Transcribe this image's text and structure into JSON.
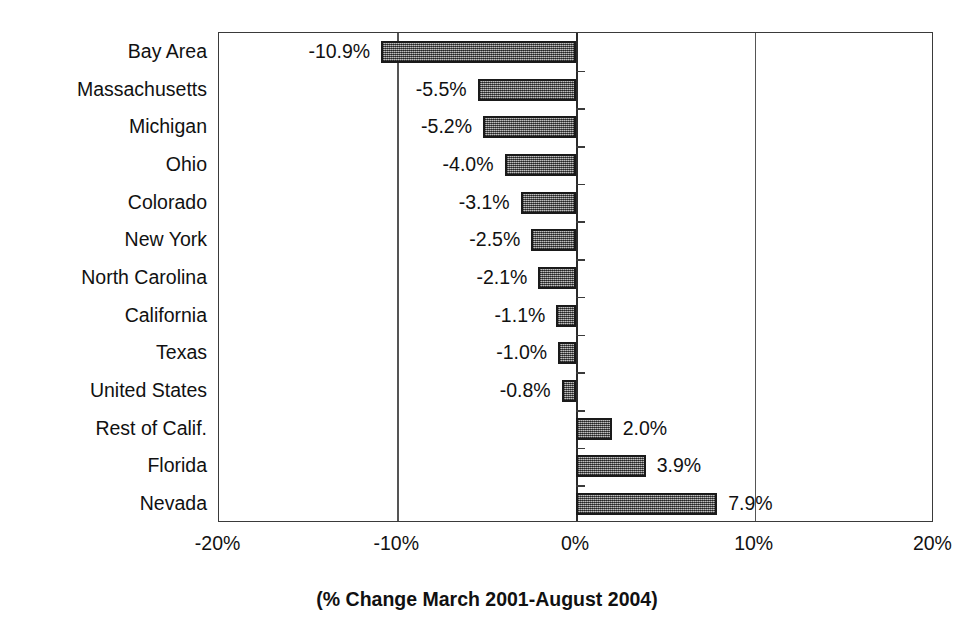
{
  "chart_data": {
    "type": "bar",
    "orientation": "horizontal",
    "title": "",
    "xlabel": "(% Change March 2001-August 2004)",
    "ylabel": "",
    "xlim": [
      -20,
      20
    ],
    "xticks": [
      "-20%",
      "-10%",
      "0%",
      "10%",
      "20%"
    ],
    "xtick_values": [
      -20,
      -10,
      0,
      10,
      20
    ],
    "grid": true,
    "legend": false,
    "categories": [
      "Bay Area",
      "Massachusetts",
      "Michigan",
      "Ohio",
      "Colorado",
      "New York",
      "North Carolina",
      "California",
      "Texas",
      "United States",
      "Rest of Calif.",
      "Florida",
      "Nevada"
    ],
    "values": [
      -10.9,
      -5.5,
      -5.2,
      -4.0,
      -3.1,
      -2.5,
      -2.1,
      -1.1,
      -1.0,
      -0.8,
      2.0,
      3.9,
      7.9
    ],
    "data_labels": [
      "-10.9%",
      "-5.5%",
      "-5.2%",
      "-4.0%",
      "-3.1%",
      "-2.5%",
      "-2.1%",
      "-1.1%",
      "-1.0%",
      "-0.8%",
      "2.0%",
      "3.9%",
      "7.9%"
    ],
    "bar_color": "#8d8d8d",
    "bar_border_color": "#1a1a1a",
    "axis_color": "#3a3a3a"
  },
  "title_remnant": "",
  "x_axis_title": "(% Change March 2001-August 2004)"
}
